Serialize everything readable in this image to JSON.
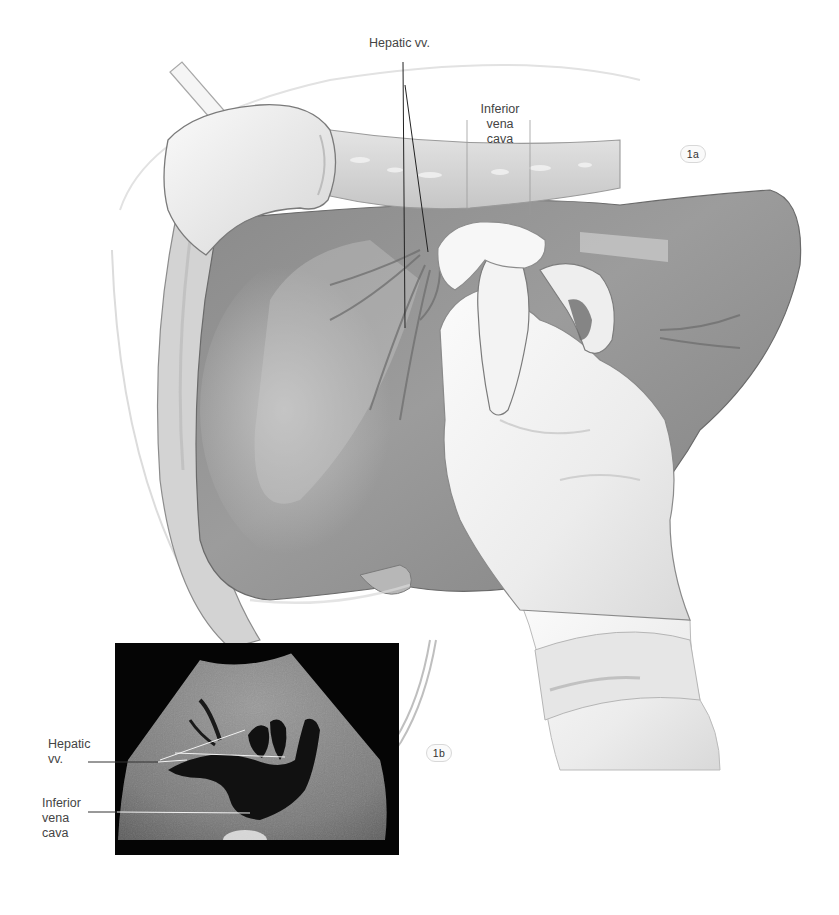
{
  "figure": {
    "panels": [
      {
        "id": "1a",
        "badge": "1a",
        "description": "Illustration of gloved hand palpating the liver surface",
        "labels": {
          "hepatic_vv": "Hepatic vv.",
          "ivc_line1": "Inferior",
          "ivc_line2": "vena",
          "ivc_line3": "cava"
        }
      },
      {
        "id": "1b",
        "badge": "1b",
        "description": "Ultrasound image of liver showing hepatic veins joining inferior vena cava",
        "labels": {
          "hepatic_line1": "Hepatic",
          "hepatic_line2": "vv.",
          "ivc_line1": "Inferior",
          "ivc_line2": "vena",
          "ivc_line3": "cava"
        }
      }
    ],
    "colors": {
      "background": "#ffffff",
      "liver_dark": "#7e7e7e",
      "liver_mid": "#9a9a9a",
      "liver_light": "#bcbcbc",
      "glove": "#f2f2f2",
      "ultrasound_bg": "#050505",
      "label_text": "#444444",
      "leader_line_dark": "#222222",
      "leader_line_light": "#e8e8e8"
    }
  }
}
